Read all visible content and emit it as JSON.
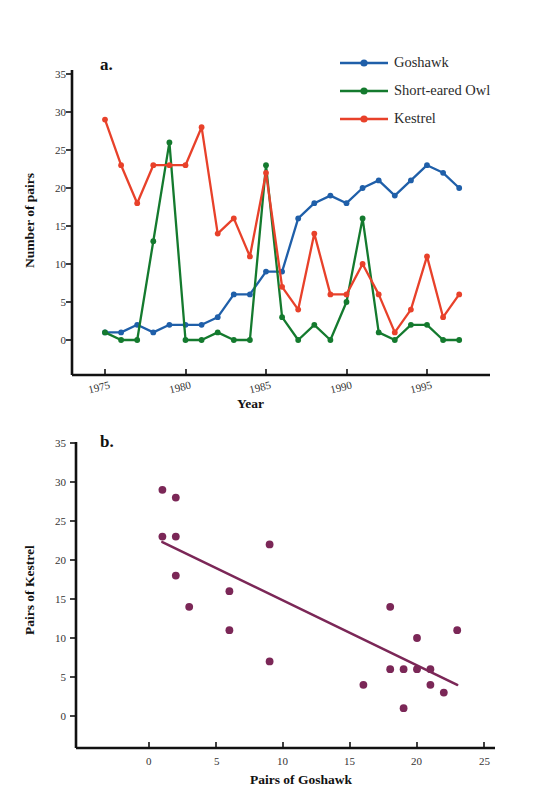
{
  "figure": {
    "clipped_header_text": "  ",
    "panel_a_label": "a.",
    "panel_b_label": "b."
  },
  "legend": {
    "position": "top-right",
    "items": [
      {
        "label": "Goshawk",
        "color": "#1f5fa9",
        "marker": "circle"
      },
      {
        "label": "Short-eared Owl",
        "color": "#147a2e",
        "marker": "circle"
      },
      {
        "label": "Kestrel",
        "color": "#e8412a",
        "marker": "circle"
      }
    ]
  },
  "colors": {
    "goshawk": "#1f5fa9",
    "short_eared_owl": "#147a2e",
    "kestrel": "#e8412a",
    "regression": "#7b2757",
    "scatter": "#7b2757",
    "axis": "#111111"
  },
  "chart_data": [
    {
      "type": "line",
      "panel": "a",
      "title": "a.",
      "xlabel": "Year",
      "ylabel": "Number of pairs",
      "grid": false,
      "legend_position": "top-right",
      "xlim": [
        1974,
        1998
      ],
      "ylim": [
        0,
        35
      ],
      "yticks": [
        0,
        5,
        10,
        15,
        20,
        25,
        30,
        35
      ],
      "ytick_labels": [
        "0",
        "5",
        "10",
        "15",
        "20",
        "25",
        "30",
        "35"
      ],
      "xticks": [
        1975,
        1980,
        1985,
        1990,
        1995
      ],
      "xtick_labels": [
        "1975",
        "1980",
        "1985",
        "1990",
        "1995"
      ],
      "x": [
        1975,
        1976,
        1977,
        1978,
        1979,
        1980,
        1981,
        1982,
        1983,
        1984,
        1985,
        1986,
        1987,
        1988,
        1989,
        1990,
        1991,
        1992,
        1993,
        1994,
        1995,
        1996,
        1997
      ],
      "series": [
        {
          "name": "Goshawk",
          "color": "#1f5fa9",
          "values": [
            1,
            1,
            2,
            1,
            2,
            2,
            2,
            3,
            6,
            6,
            9,
            9,
            16,
            18,
            19,
            18,
            20,
            21,
            19,
            21,
            23,
            22,
            20
          ]
        },
        {
          "name": "Short-eared Owl",
          "color": "#147a2e",
          "values": [
            1,
            0,
            0,
            13,
            26,
            0,
            0,
            1,
            0,
            0,
            23,
            3,
            0,
            2,
            0,
            5,
            16,
            1,
            0,
            2,
            2,
            0,
            0
          ]
        },
        {
          "name": "Kestrel",
          "color": "#e8412a",
          "values": [
            29,
            23,
            18,
            23,
            23,
            23,
            28,
            14,
            16,
            11,
            22,
            7,
            4,
            14,
            6,
            6,
            10,
            6,
            1,
            4,
            11,
            3,
            6
          ]
        }
      ]
    },
    {
      "type": "scatter",
      "panel": "b",
      "title": "b.",
      "xlabel": "Pairs of Goshawk",
      "ylabel": "Pairs of Kestrel",
      "grid": false,
      "xlim": [
        -3,
        26
      ],
      "ylim": [
        0,
        35
      ],
      "yticks": [
        0,
        5,
        10,
        15,
        20,
        25,
        30,
        35
      ],
      "ytick_labels": [
        "0",
        "5",
        "10",
        "15",
        "20",
        "25",
        "30",
        "35"
      ],
      "xticks": [
        0,
        5,
        10,
        15,
        20,
        25
      ],
      "xtick_labels": [
        "0",
        "5",
        "10",
        "15",
        "20",
        "25"
      ],
      "points": [
        {
          "x": 1,
          "y": 29
        },
        {
          "x": 2,
          "y": 28
        },
        {
          "x": 1,
          "y": 23
        },
        {
          "x": 2,
          "y": 23
        },
        {
          "x": 2,
          "y": 18
        },
        {
          "x": 3,
          "y": 14
        },
        {
          "x": 6,
          "y": 16
        },
        {
          "x": 6,
          "y": 11
        },
        {
          "x": 9,
          "y": 22
        },
        {
          "x": 9,
          "y": 7
        },
        {
          "x": 16,
          "y": 4
        },
        {
          "x": 18,
          "y": 14
        },
        {
          "x": 18,
          "y": 6
        },
        {
          "x": 19,
          "y": 6
        },
        {
          "x": 19,
          "y": 1
        },
        {
          "x": 20,
          "y": 10
        },
        {
          "x": 20,
          "y": 6
        },
        {
          "x": 21,
          "y": 6
        },
        {
          "x": 21,
          "y": 4
        },
        {
          "x": 22,
          "y": 3
        },
        {
          "x": 23,
          "y": 11
        }
      ],
      "regression_line": {
        "x1": 1,
        "y1": 22.3,
        "x2": 23,
        "y2": 4,
        "color": "#7b2757"
      }
    }
  ]
}
